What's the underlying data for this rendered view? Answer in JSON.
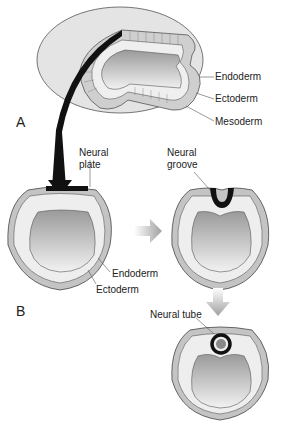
{
  "figure": {
    "panels": [
      {
        "id": "A",
        "label": "A"
      },
      {
        "id": "B",
        "label": "B"
      }
    ],
    "labels": {
      "top_endoderm": "Endoderm",
      "top_ectoderm": "Ectoderm",
      "top_mesoderm": "Mesoderm",
      "neural_plate_line1": "Neural",
      "neural_plate_line2": "plate",
      "neural_groove_line1": "Neural",
      "neural_groove_line2": "groove",
      "mid_endoderm": "Endoderm",
      "mid_ectoderm": "Ectoderm",
      "neural_tube": "Neural tube"
    },
    "colors": {
      "outer_embryo": "#e2e2e2",
      "cell_layer": "#ececec",
      "ecto_cells": "#b8b8b8",
      "cavity_light": "#f2f2f2",
      "cavity_dark": "#9a9a9a",
      "neural_tissue": "#111111",
      "arrow_gray": "#a8a8a8"
    },
    "stages": [
      "Neural plate",
      "Neural groove",
      "Neural tube"
    ]
  }
}
